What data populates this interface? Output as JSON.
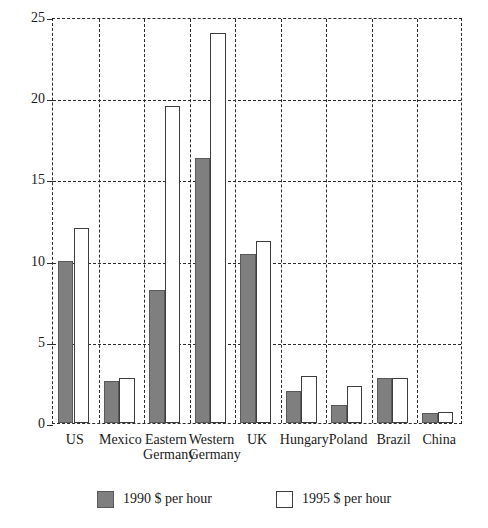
{
  "chart_data": {
    "type": "bar",
    "title": "",
    "subtitle": "",
    "xlabel": "",
    "ylabel": "",
    "ylim": [
      0,
      25
    ],
    "yticks": [
      0,
      5,
      10,
      15,
      20,
      25
    ],
    "ytick_labels": [
      "0",
      "5",
      "10",
      "15",
      "20",
      "25"
    ],
    "grid": true,
    "grid_style": "dashed",
    "legend_position": "bottom",
    "categories": [
      "US",
      "Mexico",
      "Eastern Germany",
      "Western Germany",
      "UK",
      "Hungary",
      "Poland",
      "Brazil",
      "China"
    ],
    "category_lines": [
      [
        "US",
        ""
      ],
      [
        "Mexico",
        ""
      ],
      [
        "Eastern",
        "Germany"
      ],
      [
        "Western",
        "Germany"
      ],
      [
        "UK",
        ""
      ],
      [
        "Hungary",
        ""
      ],
      [
        "Poland",
        ""
      ],
      [
        "Brazil",
        ""
      ],
      [
        "China",
        ""
      ]
    ],
    "series": [
      {
        "name": "1990 $ per hour",
        "color": "#7f7f7f",
        "values": [
          10.0,
          2.6,
          8.2,
          16.3,
          10.4,
          2.0,
          1.1,
          2.8,
          0.6
        ]
      },
      {
        "name": "1995 $ per hour",
        "color": "#ffffff",
        "values": [
          12.0,
          2.8,
          19.5,
          24.0,
          11.2,
          2.9,
          2.3,
          2.8,
          0.7
        ]
      }
    ]
  },
  "legend": {
    "items": [
      {
        "label": "1990 $ per hour",
        "swatch": "filled-gray-swatch"
      },
      {
        "label": "1995 $ per hour",
        "swatch": "outline-white-swatch"
      }
    ]
  },
  "colors": {
    "series_1990": "#7f7f7f",
    "series_1995": "#ffffff",
    "outline": "#3d3d3d",
    "grid": "#2b2b2b",
    "text": "#1a1a1a",
    "background": "#ffffff"
  }
}
